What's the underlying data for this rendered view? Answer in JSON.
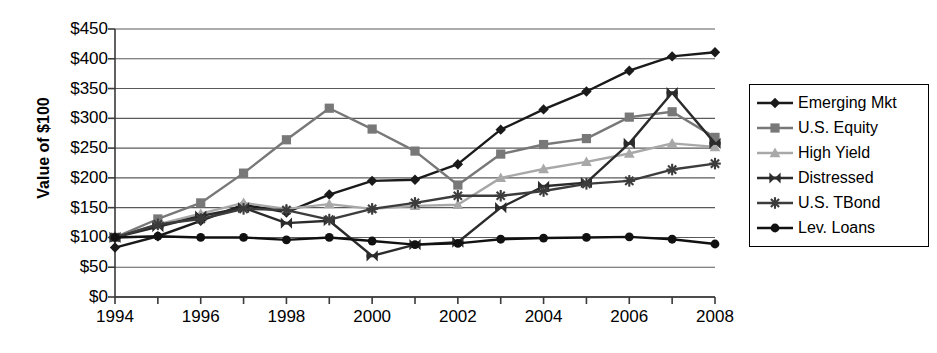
{
  "chart_data": {
    "type": "line",
    "title": "",
    "xlabel": "",
    "ylabel": "Value of $100",
    "x": [
      1994,
      1995,
      1996,
      1997,
      1998,
      1999,
      2000,
      2001,
      2002,
      2003,
      2004,
      2005,
      2006,
      2007,
      2008
    ],
    "xlim": [
      1994,
      2008
    ],
    "ylim": [
      0,
      450
    ],
    "grid": true,
    "legend_position": "right",
    "x_tick_labels": [
      "1994",
      "1996",
      "1998",
      "2000",
      "2002",
      "2004",
      "2006",
      "2008"
    ],
    "x_tick_values": [
      1994,
      1996,
      1998,
      2000,
      2002,
      2004,
      2006,
      2008
    ],
    "y_tick_labels": [
      "$450",
      "$400",
      "$350",
      "$300",
      "$250",
      "$200",
      "$150",
      "$100",
      "$50",
      "$0"
    ],
    "y_tick_values": [
      450,
      400,
      350,
      300,
      250,
      200,
      150,
      100,
      50,
      0
    ],
    "series": [
      {
        "name": "Emerging Mkt",
        "marker": "diamond",
        "color": "#1a1a1a",
        "values": [
          83,
          102,
          128,
          155,
          142,
          172,
          195,
          197,
          223,
          281,
          315,
          345,
          380,
          404,
          411
        ]
      },
      {
        "name": "U.S. Equity",
        "marker": "square",
        "color": "#787878",
        "values": [
          100,
          131,
          158,
          208,
          264,
          317,
          282,
          245,
          188,
          240,
          256,
          266,
          302,
          311,
          268
        ]
      },
      {
        "name": "High Yield",
        "marker": "triangle",
        "color": "#a8a8a8",
        "values": [
          100,
          122,
          140,
          158,
          148,
          156,
          148,
          153,
          155,
          200,
          215,
          227,
          241,
          258,
          252
        ]
      },
      {
        "name": "Distressed",
        "marker": "x-bowtie",
        "color": "#2b2b2b",
        "values": [
          100,
          118,
          136,
          150,
          124,
          128,
          69,
          88,
          92,
          150,
          186,
          192,
          258,
          343,
          258
        ]
      },
      {
        "name": "U.S. TBond",
        "marker": "asterisk",
        "color": "#3c3c3c",
        "values": [
          100,
          122,
          131,
          148,
          146,
          130,
          148,
          158,
          170,
          170,
          178,
          190,
          195,
          214,
          224
        ]
      },
      {
        "name": "Lev. Loans",
        "marker": "circle",
        "color": "#111111",
        "values": [
          100,
          102,
          100,
          100,
          96,
          100,
          94,
          88,
          90,
          97,
          99,
          100,
          101,
          97,
          89
        ]
      }
    ]
  }
}
